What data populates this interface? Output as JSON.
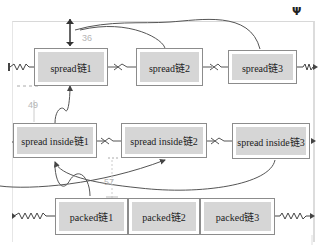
{
  "diagram": {
    "title": "",
    "rows": [
      {
        "style": "spread",
        "nodes": [
          {
            "label": "spread链1"
          },
          {
            "label": "spread链2"
          },
          {
            "label": "spread链3"
          }
        ]
      },
      {
        "style": "spread inside",
        "nodes": [
          {
            "label": "spread inside链1"
          },
          {
            "label": "spread inside链2"
          },
          {
            "label": "spread inside链3"
          }
        ]
      },
      {
        "style": "packed",
        "nodes": [
          {
            "label": "packed链1"
          },
          {
            "label": "packed链2"
          },
          {
            "label": "packed链3"
          }
        ]
      }
    ],
    "dimensions": {
      "top_margin": "36",
      "row_gap": "49",
      "inner_gap": "57"
    },
    "icons": {
      "toolbar": "wrench-icon"
    },
    "colors": {
      "node_fill": "#d6d6d6",
      "node_border": "#8c8c8c",
      "connector": "#555555",
      "dimension_text": "#b5b5b5"
    }
  }
}
